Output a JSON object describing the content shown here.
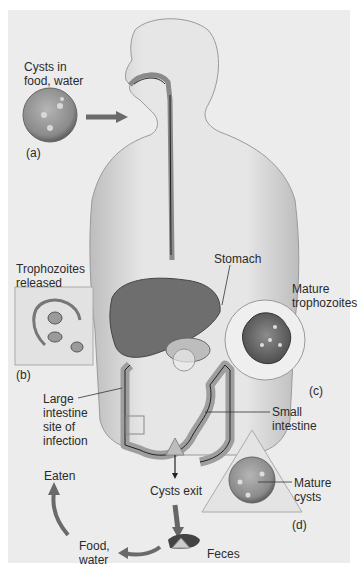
{
  "diagram": {
    "type": "parasite-life-cycle",
    "labels": {
      "cysts_in_food": "Cysts in\nfood, water",
      "trophozoites_released": "Trophozoites\nreleased",
      "stomach": "Stomach",
      "mature_trophozoites": "Mature\ntrophozoites",
      "large_intestine": "Large\nintestine\nsite of\ninfection",
      "small_intestine": "Small\nintestine",
      "eaten": "Eaten",
      "cysts_exit": "Cysts exit",
      "mature_cysts": "Mature cysts",
      "food_water": "Food,\nwater",
      "feces": "Feces"
    },
    "panel_tags": {
      "a": "(a)",
      "b": "(b)",
      "c": "(c)",
      "d": "(d)"
    },
    "colors": {
      "background": "#ececec",
      "body": "#dcdcdc",
      "liver": "#7a7a7a",
      "arrow": "#6a6a6a",
      "line": "#333333"
    }
  }
}
